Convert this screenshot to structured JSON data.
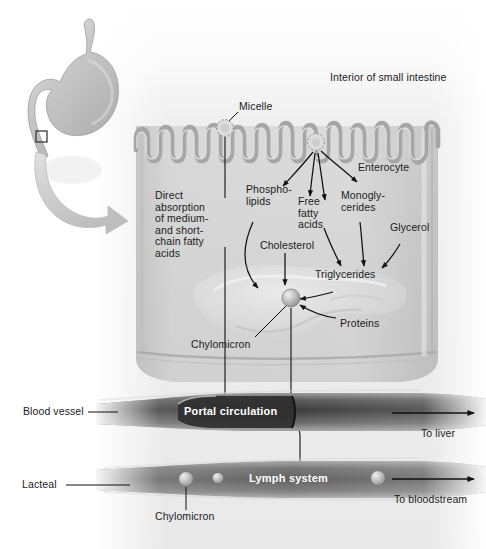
{
  "figure": {
    "type": "biological-diagram"
  },
  "labels": {
    "interior": "Interior of small intestine",
    "micelle": "Micelle",
    "enterocyte": "Enterocyte",
    "direct_absorption": "Direct\nabsorption\nof medium-\nand short-\nchain fatty\nacids",
    "phospholipids": "Phospho-\nlipids",
    "free_fatty_acids": "Free\nfatty\nacids",
    "monoglycerides": "Monogly-\ncerides",
    "glycerol": "Glycerol",
    "cholesterol": "Cholesterol",
    "triglycerides": "Triglycerides",
    "proteins": "Proteins",
    "chylomicron_cell": "Chylomicron",
    "blood_vessel": "Blood vessel",
    "lacteal": "Lacteal",
    "portal_circulation": "Portal circulation",
    "lymph_system": "Lymph system",
    "to_liver": "To liver",
    "to_bloodstream": "To bloodstream",
    "chylomicron_lacteal": "Chylomicron"
  },
  "colors": {
    "background": "#ffffff",
    "tissue": "#cfcfcf",
    "tissue_light": "#e2e2e2",
    "membrane": "#a8a8a8",
    "vessel_dark": "#4a4a4a",
    "vessel_mid": "#8f8f8f",
    "organ": "#bdbdbd",
    "text": "#1b1b1b",
    "text_inverse": "#ffffff",
    "stroke": "#111111"
  }
}
